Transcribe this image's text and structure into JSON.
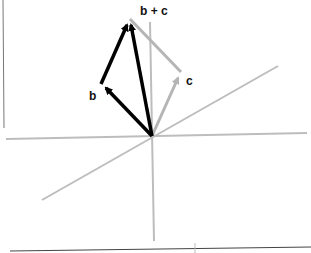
{
  "diagram": {
    "labels": {
      "b": "b",
      "c": "c",
      "sum": "b + c"
    },
    "colors": {
      "axis": "#bdbdbd",
      "vector_b": "#000000",
      "vector_c": "#b5b5b5",
      "border": "#555555"
    },
    "origin": [
      152,
      136
    ],
    "vectors": [
      {
        "name": "b",
        "tip": [
          101,
          84
        ],
        "color": "#000000"
      },
      {
        "name": "c",
        "tip": [
          181,
          72
        ],
        "color": "#b5b5b5"
      },
      {
        "name": "b + c",
        "tip": [
          129,
          18
        ],
        "color": "#000000"
      }
    ]
  }
}
